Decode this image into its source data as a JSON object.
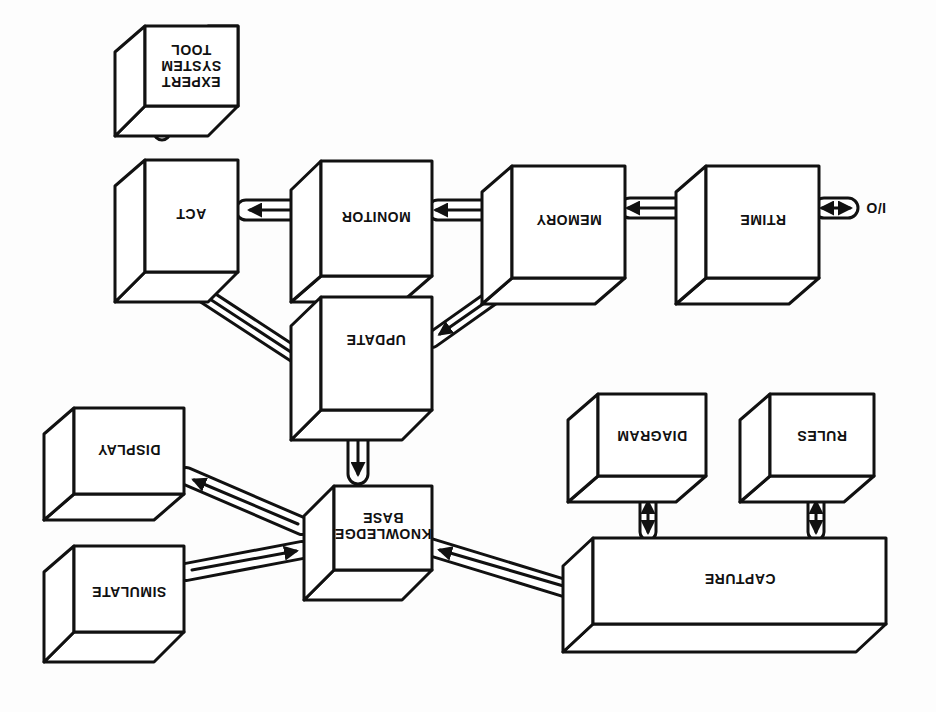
{
  "figure": {
    "orientation": "rotated-180",
    "stroke_color": "#111111",
    "fill_color": "#ffffff",
    "background": "#fdfdfd"
  },
  "nodes": {
    "expert_system_tool": {
      "label": "EXPERT\nSYSTEM\nTOOL"
    },
    "act": {
      "label": "ACT"
    },
    "monitor": {
      "label": "MONITOR"
    },
    "memory": {
      "label": "MEMORY"
    },
    "rtime": {
      "label": "RTIME"
    },
    "io": {
      "label": "I/O"
    },
    "update": {
      "label": "UPDATE"
    },
    "knowledge_base": {
      "label": "KNOWLEDGE\nBASE"
    },
    "display": {
      "label": "DISPLAY"
    },
    "simulate": {
      "label": "SIMULATE"
    },
    "capture": {
      "label": "CAPTURE"
    },
    "diagram": {
      "label": "DIAGRAM"
    },
    "rules": {
      "label": "RULES"
    }
  },
  "edges": [
    {
      "from": "act",
      "to": "expert_system_tool",
      "direction": "bidirectional"
    },
    {
      "from": "monitor",
      "to": "act",
      "direction": "forward"
    },
    {
      "from": "memory",
      "to": "monitor",
      "direction": "bidirectional"
    },
    {
      "from": "rtime",
      "to": "memory",
      "direction": "bidirectional"
    },
    {
      "from": "io",
      "to": "rtime",
      "direction": "bidirectional"
    },
    {
      "from": "update",
      "to": "act",
      "direction": "forward"
    },
    {
      "from": "memory",
      "to": "update",
      "direction": "forward"
    },
    {
      "from": "update",
      "to": "knowledge_base",
      "direction": "forward"
    },
    {
      "from": "knowledge_base",
      "to": "display",
      "direction": "forward"
    },
    {
      "from": "simulate",
      "to": "knowledge_base",
      "direction": "forward"
    },
    {
      "from": "capture",
      "to": "knowledge_base",
      "direction": "forward"
    },
    {
      "from": "capture",
      "to": "diagram",
      "direction": "bidirectional"
    },
    {
      "from": "capture",
      "to": "rules",
      "direction": "bidirectional"
    }
  ]
}
